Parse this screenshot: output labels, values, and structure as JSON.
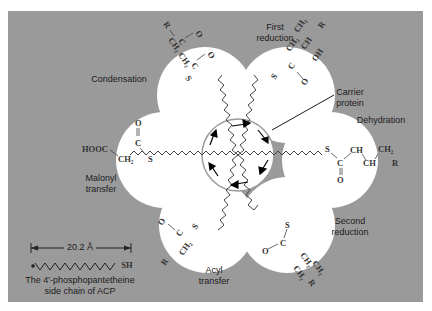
{
  "figure": {
    "background_color": "#9a9a9a",
    "circle_color": "#ffffff",
    "line_color": "#444444"
  },
  "labels": {
    "condensation": "Condensation",
    "first_reduction_line1": "First",
    "first_reduction_line2": "reduction",
    "carrier_protein_line1": "Carrier",
    "carrier_protein_line2": "protein",
    "dehydration": "Dehydration",
    "malonyl_transfer_line1": "Malonyl",
    "malonyl_transfer_line2": "transfer",
    "acyl_transfer_line1": "Acyl",
    "acyl_transfer_line2": "transfer",
    "second_reduction_line1": "Second",
    "second_reduction_line2": "reduction"
  },
  "scale_bar": {
    "length_label": "20.2 Å",
    "end_group": "SH",
    "caption_line1": "The 4′-phosphopantetheine",
    "caption_line2": "side chain of ACP"
  },
  "chemistry": {
    "condensation": [
      "R",
      "CH2",
      "C",
      "O",
      "C",
      "CH2",
      "C",
      "O",
      "S"
    ],
    "first_reduction": [
      "S",
      "C",
      "O",
      "CH2",
      "CH",
      "OH",
      "CH2",
      "R"
    ],
    "dehydration": [
      "S",
      "C",
      "O",
      "CH",
      "CH",
      "CH2",
      "R"
    ],
    "malonyl_transfer": [
      "HOOC",
      "CH2",
      "C",
      "O",
      "S"
    ],
    "acyl_transfer": [
      "S",
      "C",
      "O",
      "CH2",
      "R"
    ],
    "second_reduction": [
      "S",
      "C",
      "O",
      "CH2",
      "CH2",
      "CH2",
      "R"
    ]
  }
}
